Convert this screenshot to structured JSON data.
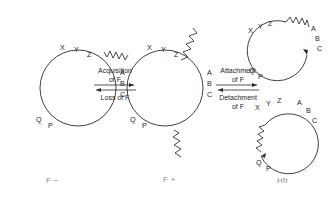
{
  "figure": {
    "background_color": "#ffffff",
    "ink_color": "#2b2b2b",
    "state_label_color": "#8a8a8a"
  },
  "genes": {
    "top": [
      "X",
      "Y",
      "Z"
    ],
    "right": [
      "A",
      "B",
      "C"
    ],
    "bottom": [
      "Q",
      "P"
    ]
  },
  "cells": [
    {
      "id": "f-minus",
      "state_label": "F −",
      "genes_top": [
        "X",
        "Y",
        "Z"
      ],
      "genes_right": [
        "A",
        "B",
        "C"
      ],
      "genes_bottom": [
        "Q",
        "P"
      ],
      "has_free_f_factor": false,
      "has_integrated_f_factor": false
    },
    {
      "id": "f-plus",
      "state_label": "F +",
      "genes_top": [
        "X",
        "Y",
        "Z"
      ],
      "genes_right": [
        "A",
        "B",
        "C"
      ],
      "genes_bottom": [
        "Q",
        "P"
      ],
      "has_free_f_factor": true,
      "has_integrated_f_factor": false
    },
    {
      "id": "hfr-top",
      "state_label": "Hfr",
      "genes_top": [
        "X",
        "Y",
        "Z"
      ],
      "genes_right": [
        "A",
        "B",
        "C"
      ],
      "genes_bottom": [
        "Q",
        "P"
      ],
      "has_free_f_factor": false,
      "has_integrated_f_factor": true,
      "integration_site": "between Z and A"
    },
    {
      "id": "hfr-bottom",
      "state_label": "Hfr",
      "genes_top": [
        "X",
        "Y",
        "Z"
      ],
      "genes_right": [
        "A",
        "B",
        "C"
      ],
      "genes_bottom": [
        "Q",
        "P"
      ],
      "has_free_f_factor": false,
      "has_integrated_f_factor": true,
      "integration_site": "between Q and X"
    }
  ],
  "reactions": [
    {
      "id": "acquisition-loss",
      "forward_label_line1": "Acquisition",
      "forward_label_line2": "of F",
      "reverse_label_line1": "Loss of F",
      "reverse_label_line2": ""
    },
    {
      "id": "attachment-detachment",
      "forward_label_line1": "Attachment",
      "forward_label_line2": "of F",
      "reverse_label_line1": "Detachment",
      "reverse_label_line2": "of F"
    }
  ],
  "state_labels": {
    "left": "F −",
    "middle": "F +",
    "right": "Hfr"
  }
}
